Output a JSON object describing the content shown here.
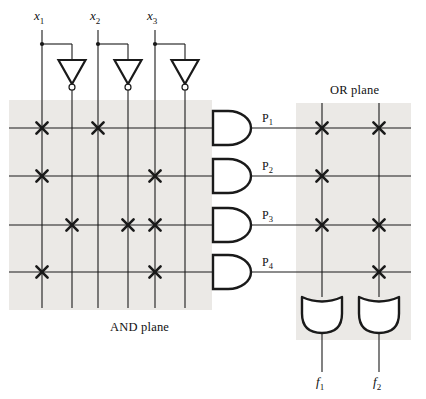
{
  "figure": {
    "kind": "programmable-logic-array",
    "background": "#ffffff",
    "ink": "#1a1a1a",
    "plane_shade": "#ebe9e6",
    "and_plane_label": "AND plane",
    "or_plane_label": "OR plane"
  },
  "inputs": [
    {
      "id": "x1",
      "label": "x",
      "sub": "1",
      "x": 42,
      "complement_x": 72
    },
    {
      "id": "x2",
      "label": "x",
      "sub": "2",
      "x": 98,
      "complement_x": 128
    },
    {
      "id": "x3",
      "label": "x",
      "sub": "3",
      "x": 155,
      "complement_x": 185
    }
  ],
  "product_terms": [
    {
      "id": "P1",
      "label": "P",
      "sub": "1",
      "y": 128,
      "and_connections": [
        42,
        98
      ],
      "or_connections": [
        322,
        379
      ]
    },
    {
      "id": "P2",
      "label": "P",
      "sub": "2",
      "y": 176,
      "and_connections": [
        42,
        155
      ],
      "or_connections": [
        322
      ]
    },
    {
      "id": "P3",
      "label": "P",
      "sub": "3",
      "y": 225,
      "and_connections": [
        72,
        128,
        155
      ],
      "or_connections": [
        322,
        379
      ]
    },
    {
      "id": "P4",
      "label": "P",
      "sub": "4",
      "y": 272,
      "and_connections": [
        42,
        155
      ],
      "or_connections": [
        379
      ]
    }
  ],
  "outputs": [
    {
      "id": "f1",
      "label": "f",
      "sub": "1",
      "x": 322
    },
    {
      "id": "f2",
      "label": "f",
      "sub": "2",
      "x": 379
    }
  ],
  "geometry": {
    "and_plane_rect": {
      "x": 9,
      "y": 100,
      "w": 203,
      "h": 210
    },
    "or_plane_rect": {
      "x": 296,
      "y": 103,
      "w": 115,
      "h": 237
    },
    "column_top_y": 30,
    "column_bottom_y": 308,
    "tap_y": 44,
    "inverter_top_y": 60,
    "inverter_bottom_y": 84,
    "and_gate": {
      "x": 213,
      "w": 38,
      "h": 34
    },
    "or_gate": {
      "y": 297,
      "w": 40,
      "h": 36
    },
    "output_stub_bottom_y": 372,
    "row_left_x": 9,
    "row_right_x": 411
  },
  "icons": {
    "inverter": "not-gate-triangle-with-bubble",
    "and_gate": "and-gate-d-shape",
    "or_gate": "or-gate-shield-shape",
    "connection": "x-cross-programmed-link",
    "tap": "junction-dot"
  }
}
